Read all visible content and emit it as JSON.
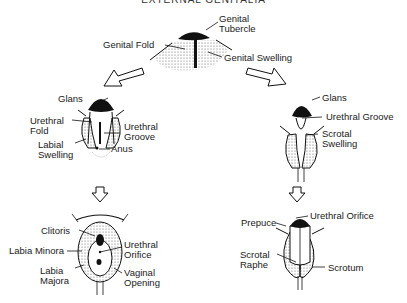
{
  "title": "EXTERNAL GENITALIA",
  "stages": {
    "indifferent": {
      "labels": {
        "genital_tubercle": "Genital\nTubercle",
        "genital_fold": "Genital Fold",
        "genital_swelling": "Genital Swelling"
      }
    },
    "female_early": {
      "labels": {
        "glans": "Glans",
        "urethral_fold": "Urethral\nFold",
        "urethral_groove": "Urethral\nGroove",
        "labial_swelling": "Labial\nSwelling",
        "anus": "Anus"
      }
    },
    "male_early": {
      "labels": {
        "glans": "Glans",
        "urethral_groove": "Urethral Groove",
        "scrotal_swelling": "Scrotal\nSwelling"
      }
    },
    "female_final": {
      "labels": {
        "clitoris": "Clitoris",
        "labia_minora": "Labia Minora",
        "urethral_orifice": "Urethral\nOrifice",
        "labia_majora": "Labia\nMajora",
        "vaginal_opening": "Vaginal\nOpening"
      }
    },
    "male_final": {
      "labels": {
        "prepuce": "Prepuce",
        "urethral_orifice": "Urethral Orifice",
        "scrotal_raphe": "Scrotal\nRaphe",
        "scrotum": "Scrotum"
      }
    }
  }
}
